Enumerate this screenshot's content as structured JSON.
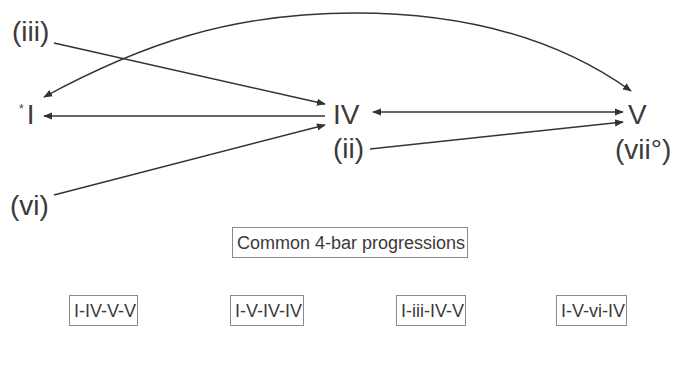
{
  "diagram": {
    "type": "chord-progression-graph",
    "nodes": [
      {
        "id": "iii",
        "label": "(iii)"
      },
      {
        "id": "I",
        "label": "I",
        "marker": "*"
      },
      {
        "id": "vi",
        "label": "(vi)"
      },
      {
        "id": "IV",
        "label": "IV"
      },
      {
        "id": "ii",
        "label": "(ii)"
      },
      {
        "id": "V",
        "label": "V"
      },
      {
        "id": "vii",
        "label": "(vii°)"
      }
    ],
    "edges": [
      {
        "from": "iii",
        "to": "IV"
      },
      {
        "from": "IV",
        "to": "I"
      },
      {
        "from": "vi",
        "to": "IV"
      },
      {
        "from": "IV",
        "to": "V",
        "bidirectional": true
      },
      {
        "from": "ii",
        "to": "V"
      },
      {
        "from": "V",
        "to": "I",
        "curved": true
      },
      {
        "from": "I",
        "to": "V",
        "curved": true
      }
    ],
    "edge_color": "#333333"
  },
  "progressions": {
    "title": "Common 4-bar progressions",
    "items": [
      "I-IV-V-V",
      "I-V-IV-IV",
      "I-iii-IV-V",
      "I-V-vi-IV"
    ]
  }
}
